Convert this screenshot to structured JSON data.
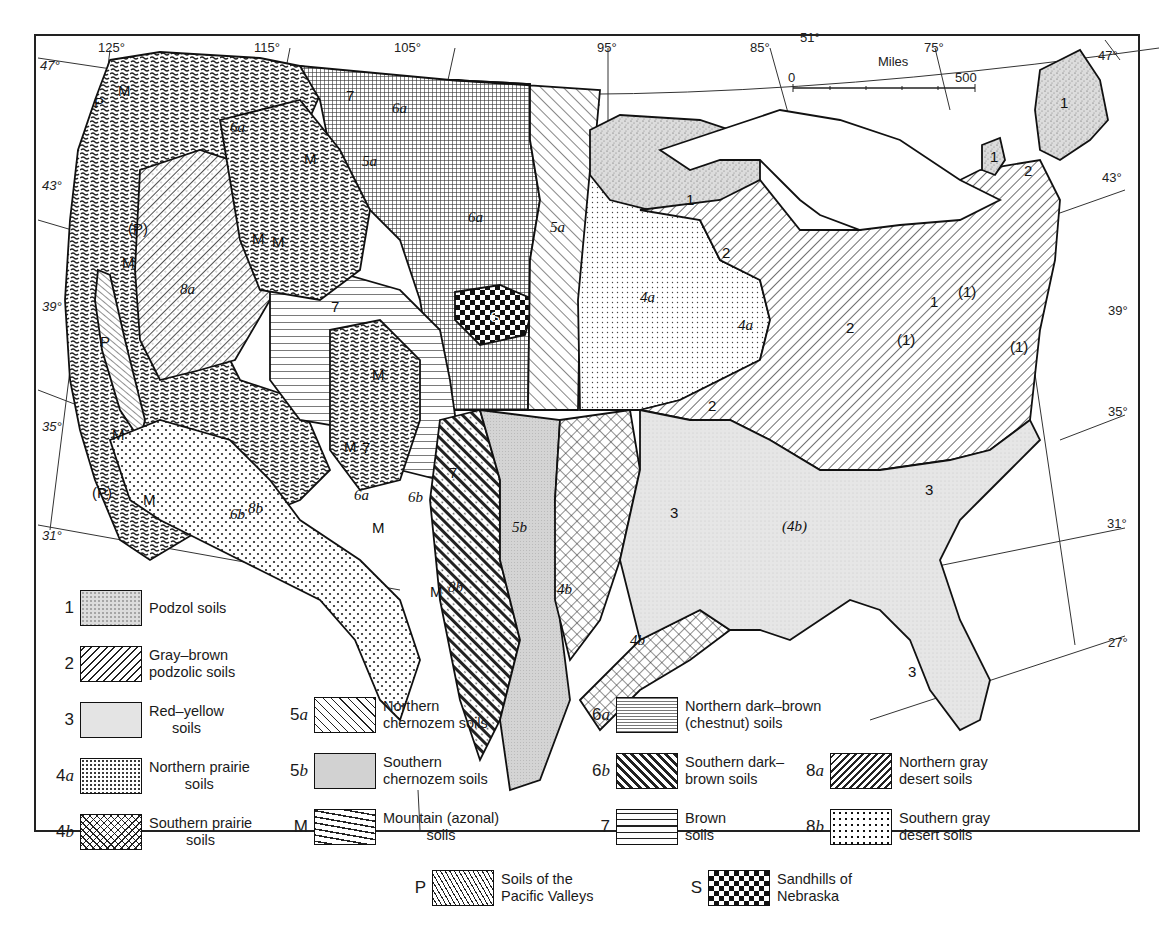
{
  "figure": {
    "type": "soil map",
    "region": "Conterminous United States"
  },
  "graticule": {
    "longitude_labels": [
      "125°",
      "115°",
      "105°",
      "95°",
      "85°",
      "51°",
      "75°"
    ],
    "latitude_labels_left": [
      "47°",
      "43°",
      "39°",
      "35°",
      "31°"
    ],
    "latitude_labels_right": [
      "47°",
      "43°",
      "39°",
      "35°",
      "31°",
      "27°"
    ]
  },
  "scale_bar": {
    "title": "Miles",
    "start": "0",
    "end": "500"
  },
  "map_labels": {
    "podzol": "1",
    "podzol_minor": "(1)",
    "gray_brown": "2",
    "red_yellow": "3",
    "n_prairie": "4a",
    "s_prairie": "4b",
    "s_prairie_minor": "(4b)",
    "n_chernozem": "5a",
    "s_chernozem": "5b",
    "n_dark_brown": "6a",
    "s_dark_brown": "6b",
    "brown": "7",
    "n_gray_desert": "8a",
    "s_gray_desert": "8b",
    "mountain": "M",
    "pacific": "P",
    "pacific_minor": "(P)",
    "sandhills": "S"
  },
  "legend": {
    "items": [
      {
        "code": "1",
        "code_italic": "",
        "label_line1": "Podzol soils",
        "label_line2": "",
        "pattern": "podzol"
      },
      {
        "code": "2",
        "code_italic": "",
        "label_line1": "Gray–brown",
        "label_line2": "podzolic soils",
        "pattern": "graybrown"
      },
      {
        "code": "3",
        "code_italic": "",
        "label_line1": "Red–yellow",
        "label_line2": "soils",
        "pattern": "redyellow"
      },
      {
        "code": "4",
        "code_italic": "a",
        "label_line1": "Northern prairie",
        "label_line2": "soils",
        "pattern": "nprairie"
      },
      {
        "code": "4",
        "code_italic": "b",
        "label_line1": "Southern prairie",
        "label_line2": "soils",
        "pattern": "sprairie"
      },
      {
        "code": "5",
        "code_italic": "a",
        "label_line1": "Northern",
        "label_line2": "chernozem soils",
        "pattern": "nchern"
      },
      {
        "code": "5",
        "code_italic": "b",
        "label_line1": "Southern",
        "label_line2": "chernozem soils",
        "pattern": "schern"
      },
      {
        "code": "M",
        "code_italic": "",
        "label_line1": "Mountain (azonal)",
        "label_line2": "soils",
        "pattern": "mountain"
      },
      {
        "code": "6",
        "code_italic": "a",
        "label_line1": "Northern dark–brown",
        "label_line2": "(chestnut) soils",
        "pattern": "ndarkbrown"
      },
      {
        "code": "6",
        "code_italic": "b",
        "label_line1": "Southern dark–",
        "label_line2": "brown soils",
        "pattern": "sdarkbrown"
      },
      {
        "code": "7",
        "code_italic": "",
        "label_line1": "Brown",
        "label_line2": "soils",
        "pattern": "brown"
      },
      {
        "code": "8",
        "code_italic": "a",
        "label_line1": "Northern gray",
        "label_line2": "desert soils",
        "pattern": "ngraydesert"
      },
      {
        "code": "8",
        "code_italic": "b",
        "label_line1": "Southern gray",
        "label_line2": "desert soils",
        "pattern": "sgraydesert"
      },
      {
        "code": "P",
        "code_italic": "",
        "label_line1": "Soils of the",
        "label_line2": "Pacific Valleys",
        "pattern": "pacific"
      },
      {
        "code": "S",
        "code_italic": "",
        "label_line1": "Sandhills of",
        "label_line2": "Nebraska",
        "pattern": "sandhills"
      }
    ]
  },
  "colors": {
    "ink": "#1a1a1a",
    "paper": "#ffffff",
    "light_stipple": "#d9d9d9",
    "dark_grid": "#555555"
  }
}
